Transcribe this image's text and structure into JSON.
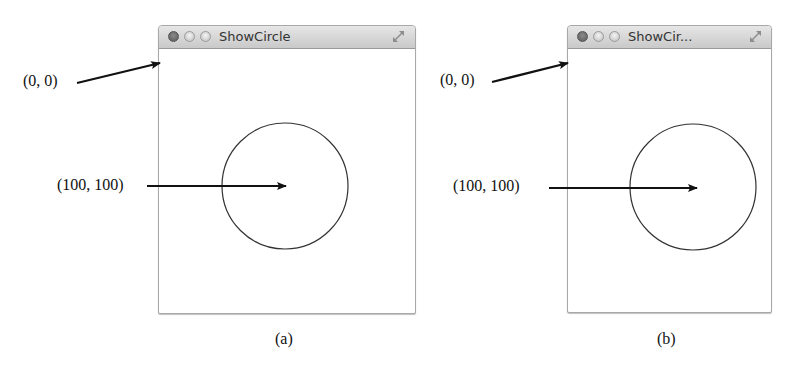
{
  "figures": [
    {
      "id": "a",
      "window": {
        "title": "ShowCircle"
      },
      "caption": "(a)",
      "annotations": {
        "origin_label": "(0, 0)",
        "center_label": "(100, 100)"
      },
      "circle": {
        "cx": 100,
        "cy": 100,
        "radius": 63
      }
    },
    {
      "id": "b",
      "window": {
        "title": "ShowCir..."
      },
      "caption": "(b)",
      "annotations": {
        "origin_label": "(0, 0)",
        "center_label": "(100, 100)"
      },
      "circle": {
        "cx": 100,
        "cy": 100,
        "radius": 63
      }
    }
  ],
  "icons": {
    "close": "close-button-icon",
    "minimize": "minimize-button-icon",
    "zoom": "zoom-button-icon",
    "fullscreen": "fullscreen-icon"
  }
}
